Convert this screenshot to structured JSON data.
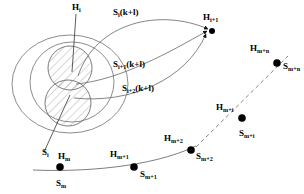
{
  "figure": {
    "type": "scientific-diagram",
    "background_color": "#ffffff",
    "stroke_color": "#555555",
    "node_color": "#000000",
    "width": 304,
    "height": 194
  },
  "labels": {
    "h_i": {
      "base": "H",
      "sub": "i",
      "text": "Hᵢ"
    },
    "h_i_plus_1": {
      "base": "H",
      "sub": "i+1",
      "text": "Hᵢ₊₁"
    },
    "s_i_k_plus_l": {
      "base": "S",
      "sub": "i",
      "suffix": "(k+l)"
    },
    "s_i1_k_plus_l": {
      "base": "S",
      "sub": "i+1",
      "suffix": "(k+l)"
    },
    "s_i2_k_plus_l": {
      "base": "S",
      "sub": "i+2",
      "suffix": "(k+l)"
    },
    "s_i": {
      "base": "S",
      "sub": "i"
    },
    "h_m": {
      "base": "H",
      "sub": "m"
    },
    "s_m": {
      "base": "S",
      "sub": "m"
    },
    "h_m_plus_1": {
      "base": "H",
      "sub": "m+1"
    },
    "s_m_plus_1": {
      "base": "S",
      "sub": "m+1"
    },
    "h_m_plus_2": {
      "base": "H",
      "sub": "m+2"
    },
    "s_m_plus_2": {
      "base": "S",
      "sub": "m+2"
    },
    "h_m_plus_i": {
      "base": "H",
      "sub": "m+i"
    },
    "s_m_plus_i": {
      "base": "S",
      "sub": "m+i"
    },
    "h_m_plus_n": {
      "base": "H",
      "sub": "m+n"
    },
    "s_m_plus_n": {
      "base": "S",
      "sub": "m+n"
    }
  },
  "label_text": {
    "h_i": "Hi",
    "h_i_plus_1": "Hi+1",
    "s_i_k": "Si(k+l)",
    "s_i1_k": "Si+1(k+l)",
    "s_i2_k": "Si+2(k+l)",
    "s_i": "Si",
    "h_m": "Hm",
    "s_m": "Sm",
    "h_m1": "Hm+1",
    "s_m1": "Sm+1",
    "h_m2": "Hm+2",
    "s_m2": "Sm+2",
    "h_mi": "Hm+i",
    "s_mi": "Sm+i",
    "h_mn": "Hm+n",
    "s_mn": "Sm+n"
  },
  "nodes": [
    {
      "name": "h_m",
      "x": 60,
      "y": 167,
      "r": 3.6
    },
    {
      "name": "h_m_plus_1",
      "x": 134,
      "y": 167,
      "r": 3.6
    },
    {
      "name": "h_m_plus_2",
      "x": 191,
      "y": 150,
      "r": 3.6
    },
    {
      "name": "h_m_plus_i",
      "x": 242,
      "y": 118,
      "r": 3.6
    },
    {
      "name": "h_m_plus_n",
      "x": 277,
      "y": 63,
      "r": 3.6
    },
    {
      "name": "h_i_plus_1",
      "x": 212,
      "y": 31,
      "r": 3.0
    }
  ],
  "shapes": {
    "outer_ellipse": {
      "cx": 70,
      "cy": 84,
      "rx": 58,
      "ry": 49
    },
    "inner_ellipse": {
      "cx": 72,
      "cy": 82,
      "rx": 42,
      "ry": 40
    },
    "hatched_circle_upper": {
      "cx": 70,
      "cy": 68,
      "r": 22
    },
    "hatched_circle_lower": {
      "cx": 68,
      "cy": 103,
      "r": 23
    }
  },
  "connectors": {
    "arrows_to_h_i_plus_1": 3,
    "dashed_segment": "h_m_plus_2 to h_m_plus_n",
    "solid_trajectory": "h_m to h_m_plus_2",
    "vertical_stem_label": "h_i",
    "diagonal_stem_label": "s_i"
  }
}
